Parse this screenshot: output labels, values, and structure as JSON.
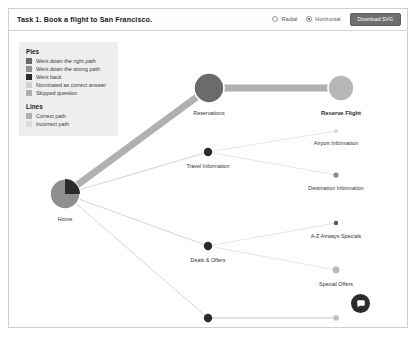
{
  "header": {
    "task_title": "Task 1. Book a flight to San Francisco.",
    "view_options": [
      {
        "label": "Radial",
        "selected": false
      },
      {
        "label": "Horizontal",
        "selected": true
      }
    ],
    "download_label": "Download SVG"
  },
  "legend": {
    "pies_title": "Pies",
    "pies": [
      {
        "label": "Went down the right path",
        "color": "#6b6b6b"
      },
      {
        "label": "Went down the wrong path",
        "color": "#8f8f8f"
      },
      {
        "label": "Went back",
        "color": "#2b2b2b"
      },
      {
        "label": "Nominated as correct answer",
        "color": "#cfcfcf"
      },
      {
        "label": "Skipped question",
        "color": "#aeaeae"
      }
    ],
    "lines_title": "Lines",
    "lines": [
      {
        "label": "Correct path",
        "color": "#b0b0b0"
      },
      {
        "label": "Incorrect path",
        "color": "#dcdcdc"
      }
    ]
  },
  "graph": {
    "nodes": [
      {
        "id": "home",
        "label": "Home",
        "x": 56,
        "y": 163,
        "r": 15,
        "kind": "pie",
        "fill": "#8f8f8f",
        "wedge_color": "#2b2b2b",
        "wedge_fraction": 0.25,
        "label_dy": 22
      },
      {
        "id": "reservations",
        "label": "Reservations",
        "x": 200,
        "y": 57,
        "r": 15,
        "kind": "solid",
        "fill": "#6b6b6b",
        "label_dy": 22
      },
      {
        "id": "reserve-flight",
        "label": "Reserve Flight",
        "x": 332,
        "y": 57,
        "r": 13,
        "kind": "solid",
        "fill": "#b8b8b8",
        "label_dy": 22,
        "emphasis": true
      },
      {
        "id": "travel-info",
        "label": "Travel Information",
        "x": 199,
        "y": 121,
        "r": 4.2,
        "kind": "solid",
        "fill": "#2b2b2b",
        "label_dy": 11
      },
      {
        "id": "airport-info",
        "label": "Airport Information",
        "x": 327,
        "y": 100,
        "r": 1.8,
        "kind": "solid",
        "fill": "#cfcfcf",
        "label_dy": 9
      },
      {
        "id": "dest-info",
        "label": "Destination Information",
        "x": 327,
        "y": 144,
        "r": 2.6,
        "kind": "solid",
        "fill": "#8a8a8a",
        "label_dy": 10
      },
      {
        "id": "deals-offers",
        "label": "Deals & Offers",
        "x": 199,
        "y": 215,
        "r": 4.2,
        "kind": "solid",
        "fill": "#2b2b2b",
        "label_dy": 11
      },
      {
        "id": "az-specials",
        "label": "A-Z Airways Specials",
        "x": 327,
        "y": 192,
        "r": 2.2,
        "kind": "solid",
        "fill": "#555555",
        "label_dy": 10
      },
      {
        "id": "special-offers",
        "label": "Special Offers",
        "x": 327,
        "y": 239,
        "r": 3.4,
        "kind": "solid",
        "fill": "#b8b8b8",
        "label_dy": 11
      },
      {
        "id": "products",
        "label": "Products & Services",
        "x": 199,
        "y": 287,
        "r": 4.2,
        "kind": "solid",
        "fill": "#2b2b2b",
        "label_dy": 11
      },
      {
        "id": "travel-products",
        "label": "Travel Products",
        "x": 327,
        "y": 287,
        "r": 2.8,
        "kind": "solid",
        "fill": "#bdbdbd",
        "label_dy": 10
      }
    ],
    "edges": [
      {
        "from": "home",
        "to": "reservations",
        "width": 7,
        "color": "#b0b0b0"
      },
      {
        "from": "reservations",
        "to": "reserve-flight",
        "width": 7,
        "color": "#b0b0b0"
      },
      {
        "from": "home",
        "to": "travel-info",
        "width": 1,
        "color": "#d6d6d6"
      },
      {
        "from": "home",
        "to": "deals-offers",
        "width": 1,
        "color": "#d6d6d6"
      },
      {
        "from": "home",
        "to": "products",
        "width": 1,
        "color": "#d6d6d6"
      },
      {
        "from": "travel-info",
        "to": "airport-info",
        "width": 0.8,
        "color": "#e0e0e0"
      },
      {
        "from": "travel-info",
        "to": "dest-info",
        "width": 0.8,
        "color": "#e0e0e0"
      },
      {
        "from": "deals-offers",
        "to": "az-specials",
        "width": 0.8,
        "color": "#e0e0e0"
      },
      {
        "from": "deals-offers",
        "to": "special-offers",
        "width": 0.8,
        "color": "#e0e0e0"
      },
      {
        "from": "products",
        "to": "travel-products",
        "width": 1.4,
        "color": "#dadada"
      }
    ]
  },
  "fab": {
    "icon": "chat-icon"
  }
}
